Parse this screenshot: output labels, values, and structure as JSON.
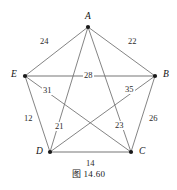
{
  "figure": {
    "caption": "图 14.60",
    "background_color": "#ffffff",
    "edge_color": "#6e6e6e",
    "vertex_color": "#1a1a1a",
    "text_color": "#1a1a1a"
  },
  "chart_data": {
    "type": "diagram",
    "title": "图 14.60",
    "graph_kind": "complete-weighted-graph-K5",
    "nodes": [
      {
        "id": "A",
        "label": "A",
        "x": 88,
        "y": 27,
        "label_x": 85,
        "label_y": 12
      },
      {
        "id": "B",
        "label": "B",
        "x": 155,
        "y": 76,
        "label_x": 163,
        "label_y": 70
      },
      {
        "id": "C",
        "label": "C",
        "x": 131,
        "y": 152,
        "label_x": 139,
        "label_y": 147
      },
      {
        "id": "D",
        "label": "D",
        "x": 50,
        "y": 152,
        "label_x": 36,
        "label_y": 147
      },
      {
        "id": "E",
        "label": "E",
        "x": 25,
        "y": 76,
        "label_x": 11,
        "label_y": 70
      }
    ],
    "edges": [
      {
        "id": "AE",
        "source": "A",
        "target": "E",
        "weight": 24,
        "label": "24",
        "label_x": 39,
        "label_y": 37,
        "kind": "perimeter"
      },
      {
        "id": "AB",
        "source": "A",
        "target": "B",
        "weight": 22,
        "label": "22",
        "label_x": 127,
        "label_y": 37,
        "kind": "perimeter"
      },
      {
        "id": "BC",
        "source": "B",
        "target": "C",
        "weight": 26,
        "label": "26",
        "label_x": 148,
        "label_y": 114,
        "kind": "perimeter"
      },
      {
        "id": "CD",
        "source": "C",
        "target": "D",
        "weight": 14,
        "label": "14",
        "label_x": 85,
        "label_y": 159,
        "kind": "perimeter"
      },
      {
        "id": "DE",
        "source": "D",
        "target": "E",
        "weight": 12,
        "label": "12",
        "label_x": 23,
        "label_y": 114,
        "kind": "perimeter"
      },
      {
        "id": "EB",
        "source": "E",
        "target": "B",
        "weight": 28,
        "label": "28",
        "label_x": 83,
        "label_y": 71,
        "kind": "diagonal"
      },
      {
        "id": "EC",
        "source": "E",
        "target": "C",
        "weight": 31,
        "label": "31",
        "label_x": 42,
        "label_y": 86,
        "kind": "diagonal"
      },
      {
        "id": "DB",
        "source": "D",
        "target": "B",
        "weight": 35,
        "label": "35",
        "label_x": 124,
        "label_y": 85,
        "kind": "diagonal"
      },
      {
        "id": "AD",
        "source": "A",
        "target": "D",
        "weight": 21,
        "label": "21",
        "label_x": 54,
        "label_y": 122,
        "kind": "diagonal"
      },
      {
        "id": "AC",
        "source": "A",
        "target": "C",
        "weight": 23,
        "label": "23",
        "label_x": 114,
        "label_y": 121,
        "kind": "diagonal"
      }
    ],
    "xlim": [
      0,
      177
    ],
    "ylim": [
      0,
      190
    ],
    "grid": false,
    "legend": false
  }
}
